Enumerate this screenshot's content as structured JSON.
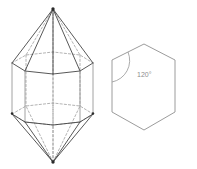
{
  "figure": {
    "title": "",
    "annotations": {
      "hexagon_interior_angle": "120°"
    }
  },
  "crystal": {
    "name": "hexagonal dipyramid on hexagonal prism",
    "top_apex": {
      "x": 53,
      "y": 9
    },
    "bottom_apex": {
      "x": 53,
      "y": 162
    },
    "upper_hexagon": {
      "front": [
        {
          "x": 12,
          "y": 63
        },
        {
          "x": 25,
          "y": 71
        },
        {
          "x": 53,
          "y": 74
        },
        {
          "x": 80,
          "y": 71
        },
        {
          "x": 93,
          "y": 63
        }
      ],
      "back": [
        {
          "x": 12,
          "y": 63
        },
        {
          "x": 26,
          "y": 55
        },
        {
          "x": 53,
          "y": 52
        },
        {
          "x": 80,
          "y": 55
        },
        {
          "x": 93,
          "y": 63
        }
      ]
    },
    "lower_hexagon": {
      "front": [
        {
          "x": 12,
          "y": 114
        },
        {
          "x": 25,
          "y": 122
        },
        {
          "x": 53,
          "y": 125
        },
        {
          "x": 80,
          "y": 122
        },
        {
          "x": 93,
          "y": 114
        }
      ],
      "back": [
        {
          "x": 12,
          "y": 114
        },
        {
          "x": 26,
          "y": 106
        },
        {
          "x": 53,
          "y": 103
        },
        {
          "x": 80,
          "y": 106
        },
        {
          "x": 93,
          "y": 114
        }
      ]
    },
    "vertical_edges": [
      {
        "x": 12,
        "y1": 63,
        "y2": 114
      },
      {
        "x": 25,
        "y1": 71,
        "y2": 122
      },
      {
        "x": 53,
        "y1": 74,
        "y2": 125
      },
      {
        "x": 80,
        "y1": 71,
        "y2": 122
      },
      {
        "x": 93,
        "y1": 63,
        "y2": 114
      },
      {
        "x": 26,
        "y1": 55,
        "y2": 106
      },
      {
        "x": 53,
        "y1": 52,
        "y2": 103
      }
    ]
  },
  "hexagon": {
    "name": "regular hexagon cross-section",
    "vertices": [
      {
        "x": 144,
        "y": 44
      },
      {
        "x": 175,
        "y": 60
      },
      {
        "x": 175,
        "y": 112
      },
      {
        "x": 144,
        "y": 130
      },
      {
        "x": 112,
        "y": 112
      },
      {
        "x": 112,
        "y": 60
      }
    ],
    "angle_marker": {
      "vertex": {
        "x": 112,
        "y": 60
      },
      "label": "120°",
      "label_position": {
        "x": 137,
        "y": 77
      }
    }
  }
}
